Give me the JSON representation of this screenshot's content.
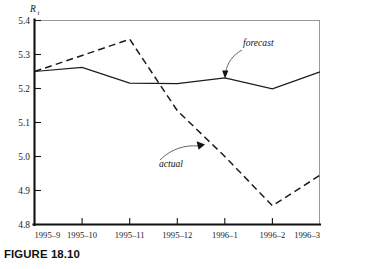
{
  "figure": {
    "caption": "FIGURE 18.10"
  },
  "chart_data": {
    "type": "line",
    "title": "",
    "xlabel": "",
    "ylabel": "R",
    "ylabel_subscript": "t",
    "ylim": [
      4.8,
      5.4
    ],
    "yticks": [
      "5.4",
      "5.3",
      "5.2",
      "5.1",
      "5.0",
      "4.9",
      "4.8"
    ],
    "ytick_values": [
      5.4,
      5.3,
      5.2,
      5.1,
      5.0,
      4.9,
      4.8
    ],
    "grid": false,
    "legend_position": "inline-annotations",
    "categories": [
      "1995–9",
      "1995–10",
      "1995–11",
      "1995–12",
      "1996–1",
      "1996–2",
      "1996–3"
    ],
    "series": [
      {
        "name": "forecast",
        "style": "solid",
        "values": [
          5.25,
          5.262,
          5.216,
          5.214,
          5.231,
          5.199,
          5.249
        ]
      },
      {
        "name": "actual",
        "style": "dashed",
        "values": [
          5.25,
          5.297,
          5.345,
          5.135,
          5.0,
          4.855,
          4.945
        ]
      }
    ],
    "annotations": [
      {
        "text": "forecast",
        "series": "forecast",
        "points_to_category": "1996–1"
      },
      {
        "text": "actual",
        "series": "actual",
        "points_to_category": "1995–12"
      }
    ]
  },
  "colors": {
    "axis": "#101010",
    "frame_light": "#8d8d8d",
    "series_line": "#1b1b1b",
    "text": "#1a1a1a",
    "background": "#ffffff"
  }
}
